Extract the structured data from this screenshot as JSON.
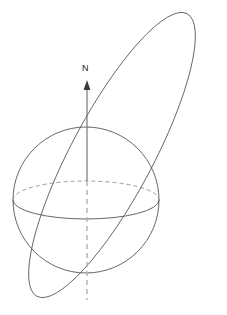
{
  "figure": {
    "type": "line-diagram",
    "width": 227,
    "height": 315,
    "background_color": "#ffffff"
  },
  "labels": {
    "north_pole": "N"
  },
  "colors": {
    "sphere_outline": "#555555",
    "equator_front": "#555555",
    "equator_back_dashed": "#8e8e8e",
    "orbit": "#555555",
    "axis_solid": "#6a6a6a",
    "axis_dashed": "#b0b0b0",
    "arrow_head": "#3a3a3a",
    "label_text": "#222222"
  },
  "geometry": {
    "sphere": {
      "center_x": 86,
      "center_y": 200,
      "radius": 73,
      "note": "great circle silhouette of the globe"
    },
    "equator": {
      "center_x": 86,
      "center_y": 200,
      "rx": 73,
      "ry": 19,
      "front_half": "solid (lower arc)",
      "back_half": "dashed (upper arc)"
    },
    "rotation_axis": {
      "x": 87,
      "top_y": 82,
      "bottom_y": 300,
      "solid_from_y": 82,
      "solid_to_y": 180,
      "dashed_from_y": 180,
      "dashed_to_y": 300,
      "arrow_tip_y": 82,
      "arrow_length": 10
    },
    "orbit_ellipse": {
      "center_x": 112,
      "center_y": 155,
      "semi_major": 160,
      "semi_minor": 41,
      "rotation_deg": -62,
      "apex_x": 207,
      "apex_y": 12,
      "low_x": 20,
      "low_y": 298,
      "note": "highly inclined elongated orbit crossing the equatorial plane"
    },
    "axis_label_position": {
      "x": 82,
      "y": 66
    }
  }
}
